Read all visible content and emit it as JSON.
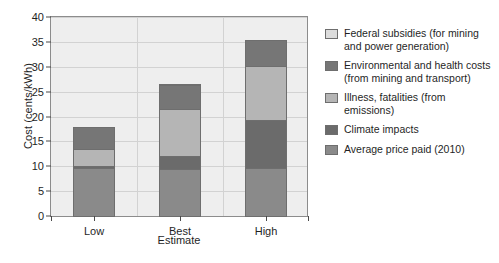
{
  "chart_data": {
    "type": "bar",
    "subtype": "stacked-bar",
    "title": "",
    "xlabel": "Estimate",
    "ylabel": "Cost (cents/kWh)",
    "categories": [
      "Low",
      "Best",
      "High"
    ],
    "ylim": [
      0,
      40
    ],
    "yticks": [
      0,
      5,
      10,
      15,
      20,
      25,
      30,
      35,
      40
    ],
    "ytick_labels": [
      "0",
      "5",
      "10",
      "15",
      "20",
      "25",
      "30",
      "35",
      "40"
    ],
    "grid": true,
    "legend_position": "right",
    "series": [
      {
        "name": "Average price paid (2010)",
        "color": "#8a8a8a",
        "values": [
          9.8,
          9.6,
          9.8
        ]
      },
      {
        "name": "Climate impacts",
        "color": "#6b6b6b",
        "values": [
          0.7,
          2.8,
          9.9
        ]
      },
      {
        "name": "Illness, fatalities (from emissions)",
        "color": "#b5b5b5",
        "values": [
          3.5,
          9.8,
          11.1
        ]
      },
      {
        "name": "Environmental and health costs (from mining and transport)",
        "color": "#767676",
        "values": [
          4.8,
          4.9,
          5.4
        ]
      },
      {
        "name": "Federal subsidies (for mining and power generation)",
        "color": "#dcdcdc",
        "values": [
          0.0,
          0.5,
          0.0
        ]
      }
    ],
    "totals": [
      18.8,
      27.6,
      36.2
    ]
  },
  "legend": {
    "items": [
      {
        "label": "Federal subsidies (for mining and power generation)",
        "color": "#dcdcdc"
      },
      {
        "label": "Environmental and health costs (from mining and transport)",
        "color": "#767676"
      },
      {
        "label": "Illness, fatalities (from emissions)",
        "color": "#b5b5b5"
      },
      {
        "label": "Climate impacts",
        "color": "#6b6b6b"
      },
      {
        "label": "Average price paid (2010)",
        "color": "#8a8a8a"
      }
    ]
  },
  "colors": {
    "plot_background": "#eeeeee",
    "grid": "#d2d2d2",
    "axis": "#8c8c8c",
    "bar_outline": "#6e6e6e",
    "text": "#1f1f1f",
    "page_background": "#ffffff"
  }
}
